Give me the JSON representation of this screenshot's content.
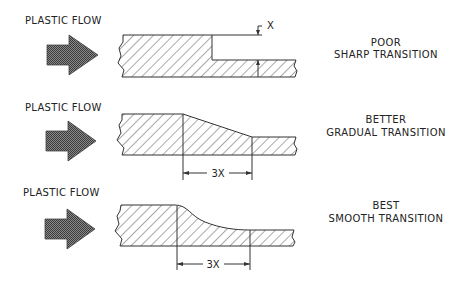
{
  "rows": [
    {
      "flow_label": "PLASTIC FLOW",
      "rating": "POOR",
      "transition": "SHARP TRANSITION",
      "dimension_label": "X"
    },
    {
      "flow_label": "PLASTIC FLOW",
      "rating": "BETTER",
      "transition": "GRADUAL TRANSITION",
      "dimension_label": "3X"
    },
    {
      "flow_label": "PLASTIC FLOW",
      "rating": "BEST",
      "transition": "SMOOTH TRANSITION",
      "dimension_label": "3X"
    }
  ],
  "icons": {
    "flow_arrow": "right-arrow-stippled"
  },
  "colors": {
    "line": "#333333",
    "arrow_fill": "#555555",
    "text": "#222222",
    "background": "#ffffff"
  }
}
